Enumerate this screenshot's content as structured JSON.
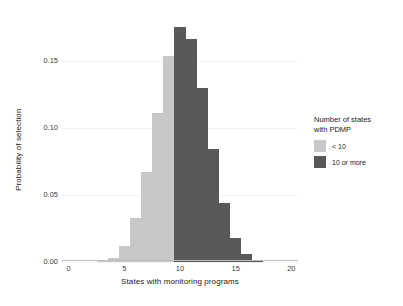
{
  "chart_data": {
    "type": "bar",
    "title": "",
    "xlabel": "States with monitoring programs",
    "ylabel": "Probability of selection",
    "xlim": [
      -0.6,
      20.6
    ],
    "ylim": [
      0.0,
      0.182
    ],
    "xticks": [
      0,
      5,
      10,
      15,
      20
    ],
    "xtick_labels": [
      "0",
      "5",
      "10",
      "15",
      "20"
    ],
    "yticks": [
      0.0,
      0.05,
      0.1,
      0.15
    ],
    "ytick_labels": [
      "0.00",
      "0.05",
      "0.10",
      "0.15"
    ],
    "grid": true,
    "legend_position": "right",
    "categories": [
      3,
      4,
      5,
      6,
      7,
      8,
      9,
      10,
      11,
      12,
      13,
      14,
      15,
      16,
      17
    ],
    "values": [
      0.0014,
      0.0032,
      0.0122,
      0.033,
      0.0668,
      0.111,
      0.154,
      0.1755,
      0.1665,
      0.13,
      0.084,
      0.044,
      0.0178,
      0.0058,
      0.0012
    ],
    "groups": [
      "< 10",
      "< 10",
      "< 10",
      "< 10",
      "< 10",
      "< 10",
      "< 10",
      "10 or more",
      "10 or more",
      "10 or more",
      "10 or more",
      "10 or more",
      "10 or more",
      "10 or more",
      "10 or more"
    ],
    "series": [
      {
        "name": "< 10",
        "color": "#c8c8c8",
        "x": [
          3,
          4,
          5,
          6,
          7,
          8,
          9
        ],
        "values": [
          0.0014,
          0.0032,
          0.0122,
          0.033,
          0.0668,
          0.111,
          0.154
        ]
      },
      {
        "name": "10 or more",
        "color": "#595959",
        "x": [
          10,
          11,
          12,
          13,
          14,
          15,
          16,
          17
        ],
        "values": [
          0.1755,
          0.1665,
          0.13,
          0.084,
          0.044,
          0.0178,
          0.0058,
          0.0012
        ]
      }
    ]
  },
  "legend": {
    "title_line1": "Number of states",
    "title_line2": "with PDMP",
    "items": [
      {
        "label": "< 10",
        "color": "#c8c8c8"
      },
      {
        "label": "10 or more",
        "color": "#595959"
      }
    ]
  },
  "colors": {
    "light_gray": "#c8c8c8",
    "dark_gray": "#595959",
    "grid": "#f2f2f2",
    "axis": "#bdbdbd",
    "text": "#1a1a1a",
    "tick_text": "#3d3d3d",
    "background": "#ffffff"
  }
}
